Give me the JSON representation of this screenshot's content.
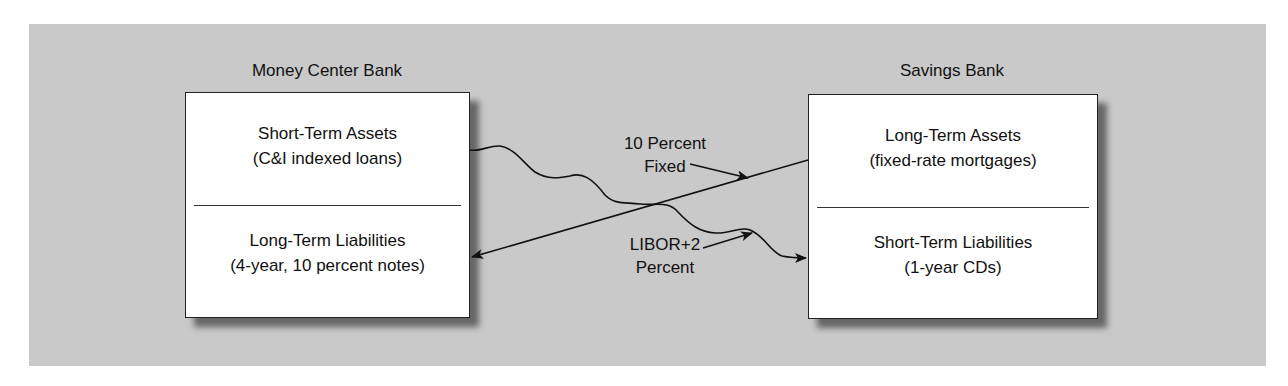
{
  "diagram": {
    "type": "interest rate swap",
    "left_bank": {
      "title": "Money Center Bank",
      "assets": {
        "line1": "Short-Term Assets",
        "line2": "(C&I indexed loans)"
      },
      "liabilities": {
        "line1": "Long-Term Liabilities",
        "line2": "(4-year, 10 percent notes)"
      }
    },
    "right_bank": {
      "title": "Savings Bank",
      "assets": {
        "line1": "Long-Term Assets",
        "line2": "(fixed-rate mortgages)"
      },
      "liabilities": {
        "line1": "Short-Term Liabilities",
        "line2": "(1-year CDs)"
      }
    },
    "flows": [
      {
        "label_line1": "10 Percent",
        "label_line2": "Fixed",
        "from": "Savings Bank",
        "to": "Money Center Bank",
        "style": "straight"
      },
      {
        "label_line1": "LIBOR+2",
        "label_line2": "Percent",
        "from": "Money Center Bank",
        "to": "Savings Bank",
        "style": "wavy"
      }
    ],
    "colors": {
      "background_panel": "#c9c9c9",
      "box_fill": "#ffffff",
      "line": "#111111",
      "shadow": "#555555"
    }
  }
}
